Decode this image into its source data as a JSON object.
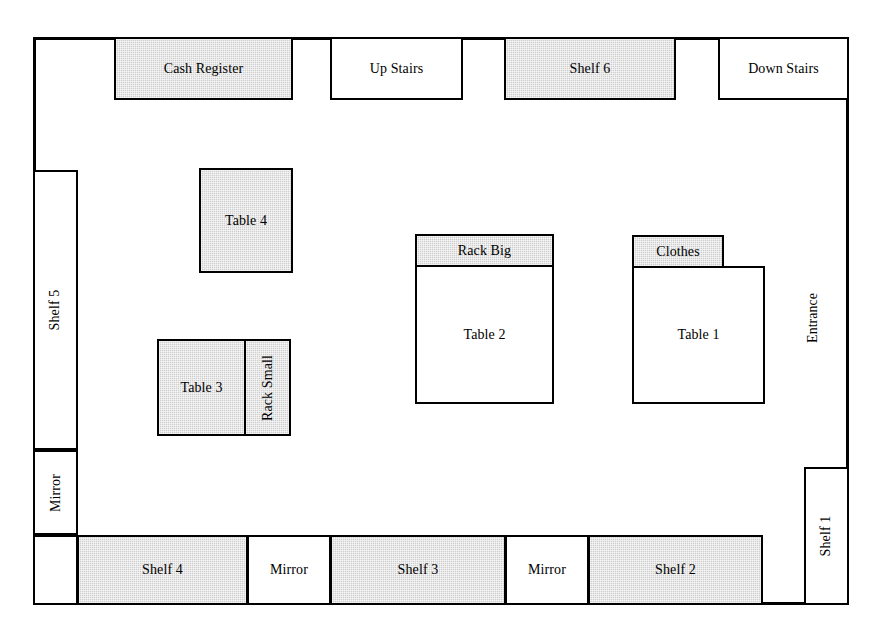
{
  "legend": {
    "shaded_fill": "#cfcfcf",
    "outline": "#000000",
    "background": "#ffffff"
  },
  "fixtures": {
    "cash_register": "Cash Register",
    "up_stairs": "Up Stairs",
    "shelf6": "Shelf 6",
    "down_stairs": "Down Stairs",
    "shelf5": "Shelf 5",
    "mirror_left": "Mirror",
    "table4": "Table 4",
    "table3": "Table 3",
    "rack_small": "Rack Small",
    "rack_big": "Rack Big",
    "table2": "Table 2",
    "clothes": "Clothes",
    "table1": "Table 1",
    "entrance": "Entrance",
    "shelf1": "Shelf 1",
    "shelf4": "Shelf 4",
    "mirror_bottom_1": "Mirror",
    "shelf3": "Shelf 3",
    "mirror_bottom_2": "Mirror",
    "shelf2": "Shelf 2"
  }
}
